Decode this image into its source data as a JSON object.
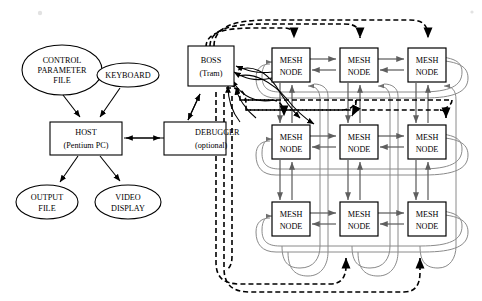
{
  "diagram": {
    "host_side": {
      "control_parameter_file": {
        "line1": "CONTROL",
        "line2": "PARAMETER",
        "line3": "FILE"
      },
      "keyboard": {
        "line1": "KEYBOARD"
      },
      "host": {
        "line1": "HOST",
        "line2": "(Pentium PC)"
      },
      "output_file": {
        "line1": "OUTPUT",
        "line2": "FILE"
      },
      "video_display": {
        "line1": "VIDEO",
        "line2": "DISPLAY"
      },
      "debugger": {
        "line1": "DEBUGGER",
        "line2": "(optional)"
      }
    },
    "boss": {
      "line1": "BOSS",
      "line2": "(Tram)"
    },
    "mesh": {
      "node_label_line1": "MESH",
      "node_label_line2": "NODE",
      "rows": 3,
      "cols": 3,
      "nodes": [
        {
          "id": "n00",
          "row": 0,
          "col": 0,
          "line1": "MESH",
          "line2": "NODE"
        },
        {
          "id": "n01",
          "row": 0,
          "col": 1,
          "line1": "MESH",
          "line2": "NODE"
        },
        {
          "id": "n02",
          "row": 0,
          "col": 2,
          "line1": "MESH",
          "line2": "NODE"
        },
        {
          "id": "n10",
          "row": 1,
          "col": 0,
          "line1": "MESH",
          "line2": "NODE"
        },
        {
          "id": "n11",
          "row": 1,
          "col": 1,
          "line1": "MESH",
          "line2": "NODE"
        },
        {
          "id": "n12",
          "row": 1,
          "col": 2,
          "line1": "MESH",
          "line2": "NODE"
        },
        {
          "id": "n20",
          "row": 2,
          "col": 0,
          "line1": "MESH",
          "line2": "NODE"
        },
        {
          "id": "n21",
          "row": 2,
          "col": 1,
          "line1": "MESH",
          "line2": "NODE"
        },
        {
          "id": "n22",
          "row": 2,
          "col": 2,
          "line1": "MESH",
          "line2": "NODE"
        }
      ]
    },
    "colors": {
      "background": "#ffffff",
      "outline": "#000000",
      "mesh_link": "#5f5f5f",
      "mesh_wrap": "#8a8a8a",
      "control_link": "#000000"
    }
  }
}
